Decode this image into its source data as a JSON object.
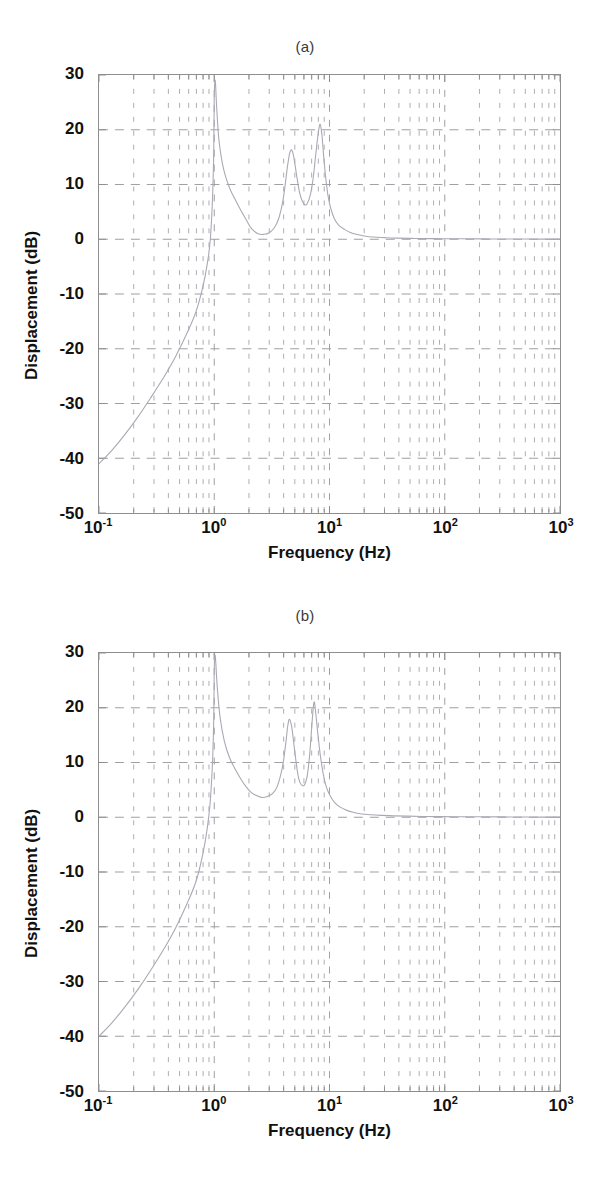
{
  "page": {
    "background_color": "#ffffff",
    "axis_color": "#8e8e8e",
    "grid_color": "#9a9aa0",
    "curve_color": "#a9a9b4",
    "text_color": "#111111"
  },
  "panels": [
    {
      "id": "a",
      "title": "(a)",
      "xlabel": "Frequency  (Hz)",
      "ylabel": "Displacement (dB)",
      "yticks": [
        "30",
        "20",
        "10",
        "0",
        "-10",
        "-20",
        "-30",
        "-40",
        "-50"
      ],
      "xticks": [
        {
          "mantissa": "10",
          "exp": "-1"
        },
        {
          "mantissa": "10",
          "exp": "0"
        },
        {
          "mantissa": "10",
          "exp": "1"
        },
        {
          "mantissa": "10",
          "exp": "2"
        },
        {
          "mantissa": "10",
          "exp": "3"
        }
      ]
    },
    {
      "id": "b",
      "title": "(b)",
      "xlabel": "Frequency  (Hz)",
      "ylabel": "Displacement (dB)",
      "yticks": [
        "30",
        "20",
        "10",
        "0",
        "-10",
        "-20",
        "-30",
        "-40",
        "-50"
      ],
      "xticks": [
        {
          "mantissa": "10",
          "exp": "-1"
        },
        {
          "mantissa": "10",
          "exp": "0"
        },
        {
          "mantissa": "10",
          "exp": "1"
        },
        {
          "mantissa": "10",
          "exp": "2"
        },
        {
          "mantissa": "10",
          "exp": "3"
        }
      ]
    }
  ],
  "chart_data": [
    {
      "type": "line",
      "title": "(a)",
      "xlabel": "Frequency  (Hz)",
      "ylabel": "Displacement (dB)",
      "xscale": "log",
      "xlim": [
        0.1,
        1000
      ],
      "ylim": [
        -50,
        30
      ],
      "yticks": [
        -50,
        -40,
        -30,
        -20,
        -10,
        0,
        10,
        20,
        30
      ],
      "xticks": [
        0.1,
        1,
        10,
        100,
        1000
      ],
      "grid": true,
      "grid_minor": true,
      "legend": null,
      "annotations": [],
      "series": [
        {
          "name": "Displacement magnitude",
          "color": "#a9a9b4",
          "x": [
            0.1,
            0.13,
            0.17,
            0.22,
            0.28,
            0.36,
            0.46,
            0.6,
            0.7,
            0.8,
            0.87,
            0.92,
            0.95,
            0.97,
            0.99,
            1.0,
            1.02,
            1.05,
            1.1,
            1.2,
            1.35,
            1.5,
            1.7,
            1.9,
            2.1,
            2.4,
            2.7,
            3.0,
            3.3,
            3.6,
            3.9,
            4.1,
            4.3,
            4.5,
            4.7,
            4.9,
            5.2,
            5.5,
            5.8,
            6.1,
            6.4,
            6.8,
            7.2,
            7.6,
            8.0,
            8.3,
            8.6,
            8.8,
            9.0,
            9.3,
            9.7,
            10.2,
            11.0,
            12.0,
            13.5,
            15.0,
            17.0,
            20.0,
            24.0,
            30.0,
            40.0,
            55.0,
            75.0,
            100.0,
            150.0,
            220.0,
            320.0,
            480.0,
            700.0,
            1000.0
          ],
          "y": [
            -41.0,
            -38.5,
            -35.5,
            -32.3,
            -29.0,
            -25.4,
            -21.5,
            -16.5,
            -13.0,
            -8.5,
            -4.5,
            -0.5,
            4.0,
            8.5,
            16.0,
            26.0,
            29.0,
            24.0,
            18.0,
            13.0,
            9.5,
            7.5,
            5.3,
            3.5,
            2.0,
            1.0,
            0.9,
            1.2,
            2.0,
            3.6,
            6.5,
            9.5,
            13.0,
            15.6,
            16.3,
            15.0,
            11.5,
            8.5,
            7.0,
            6.3,
            6.5,
            8.0,
            11.0,
            15.5,
            19.5,
            21.0,
            19.0,
            16.5,
            14.0,
            11.0,
            8.0,
            5.8,
            3.8,
            2.6,
            1.8,
            1.3,
            0.9,
            0.6,
            0.4,
            0.3,
            0.2,
            0.15,
            0.12,
            0.1,
            0.08,
            0.06,
            0.05,
            0.04,
            0.03,
            0.02
          ]
        }
      ],
      "features": {
        "low_frequency_slope_db_per_decade": 40,
        "resonance_peaks_hz": [
          1.0,
          4.7,
          8.3
        ],
        "resonance_peak_db": [
          29,
          16.3,
          21.0
        ],
        "antiresonance_dips_hz": [
          2.6,
          6.2
        ],
        "antiresonance_dip_db": [
          0.9,
          6.3
        ],
        "high_frequency_asymptote_db": 0
      }
    },
    {
      "type": "line",
      "title": "(b)",
      "xlabel": "Frequency  (Hz)",
      "ylabel": "Displacement (dB)",
      "xscale": "log",
      "xlim": [
        0.1,
        1000
      ],
      "ylim": [
        -50,
        30
      ],
      "yticks": [
        -50,
        -40,
        -30,
        -20,
        -10,
        0,
        10,
        20,
        30
      ],
      "xticks": [
        0.1,
        1,
        10,
        100,
        1000
      ],
      "grid": true,
      "grid_minor": true,
      "legend": null,
      "annotations": [],
      "series": [
        {
          "name": "Displacement magnitude",
          "color": "#a9a9b4",
          "x": [
            0.1,
            0.13,
            0.17,
            0.22,
            0.28,
            0.36,
            0.46,
            0.58,
            0.7,
            0.8,
            0.87,
            0.92,
            0.95,
            0.97,
            0.99,
            1.0,
            1.02,
            1.06,
            1.12,
            1.22,
            1.35,
            1.5,
            1.7,
            1.9,
            2.1,
            2.3,
            2.6,
            2.9,
            3.2,
            3.5,
            3.8,
            4.0,
            4.2,
            4.35,
            4.5,
            4.7,
            4.9,
            5.1,
            5.3,
            5.5,
            5.8,
            6.1,
            6.4,
            6.7,
            6.9,
            7.1,
            7.25,
            7.4,
            7.6,
            7.9,
            8.3,
            8.8,
            9.4,
            10.2,
            11.2,
            12.5,
            14.0,
            16.0,
            19.0,
            23.0,
            28.0,
            36.0,
            48.0,
            65.0,
            90.0,
            130.0,
            200.0,
            320.0,
            520.0,
            1000.0
          ],
          "y": [
            -40.0,
            -37.5,
            -34.5,
            -31.3,
            -28.0,
            -24.3,
            -20.3,
            -15.8,
            -11.5,
            -6.5,
            -2.0,
            2.5,
            7.0,
            11.0,
            18.0,
            27.0,
            29.5,
            24.0,
            18.5,
            14.0,
            11.0,
            9.0,
            7.0,
            5.5,
            4.5,
            4.0,
            3.6,
            3.8,
            4.3,
            5.5,
            8.0,
            10.5,
            14.0,
            16.8,
            17.9,
            16.5,
            13.5,
            10.5,
            8.0,
            6.5,
            5.8,
            6.0,
            7.5,
            11.0,
            14.5,
            18.0,
            20.3,
            21.0,
            19.0,
            15.5,
            11.5,
            8.0,
            5.5,
            3.8,
            2.6,
            1.8,
            1.3,
            0.9,
            0.6,
            0.45,
            0.35,
            0.25,
            0.2,
            0.15,
            0.12,
            0.1,
            0.08,
            0.06,
            0.04,
            0.02
          ]
        }
      ],
      "features": {
        "low_frequency_slope_db_per_decade": 40,
        "resonance_peaks_hz": [
          1.0,
          4.5,
          7.4
        ],
        "resonance_peak_db": [
          29.5,
          17.9,
          21.0
        ],
        "antiresonance_dips_hz": [
          2.6,
          5.7
        ],
        "antiresonance_dip_db": [
          3.6,
          5.8
        ],
        "high_frequency_asymptote_db": 0
      }
    }
  ]
}
